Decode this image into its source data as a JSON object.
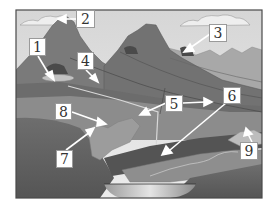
{
  "diagram": {
    "type": "landscape-cross-section",
    "colors": {
      "sky": "#e2e2e2",
      "mountain": "#7c7c7c",
      "mountain_dark": "#5f5f5f",
      "ridge_light": "#a9a9a9",
      "layer_light": "#9a9a9a",
      "layer_dark": "#545454",
      "bedrock": "#626262",
      "water": "#cfcfcf",
      "label_bg": "#ffffff",
      "arrow": "#ffffff",
      "frame": "#4a4a4a"
    },
    "labels": [
      {
        "id": "1",
        "text": "1"
      },
      {
        "id": "2",
        "text": "2"
      },
      {
        "id": "3",
        "text": "3"
      },
      {
        "id": "4",
        "text": "4"
      },
      {
        "id": "5",
        "text": "5"
      },
      {
        "id": "6",
        "text": "6"
      },
      {
        "id": "7",
        "text": "7"
      },
      {
        "id": "8",
        "text": "8"
      },
      {
        "id": "9",
        "text": "9"
      }
    ]
  }
}
